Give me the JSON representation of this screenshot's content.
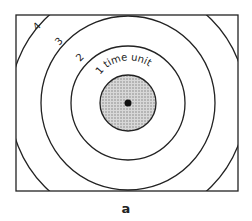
{
  "diagram": {
    "labels": {
      "ring1": "1 time unit",
      "ring2": "2",
      "ring3": "3",
      "ring4": "4"
    },
    "caption": "a",
    "colors": {
      "line": "#222222",
      "shade": "#bdbdbd",
      "background": "#ffffff"
    }
  }
}
